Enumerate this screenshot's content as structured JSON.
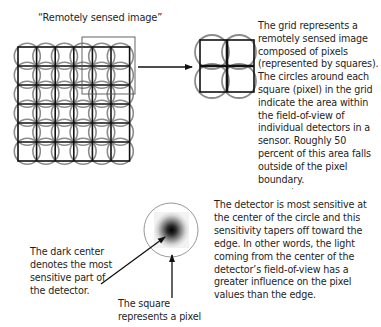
{
  "diagram": {
    "grid_title": "“Remotely sensed image”",
    "grid_description": "The grid represents a remotely sensed image composed of pixels (represented by squares). The circles around each square (pixel) in the grid indicate the area within the field-of-view of individual detectors in a sensor. Roughly 50 percent of this area falls outside of the pixel boundary.",
    "detector_description": "The detector is most sensitive at the center of the circle and this sensitivity tapers off toward the edge. In other words, the light coming from the center of the detector’s field-of-view has a greater influence on the pixel values than the edge.",
    "dark_center_caption": "The dark center denotes the most sensitive part of the detector.",
    "square_caption": "The square represents a pixel",
    "grid": {
      "rows": 6,
      "cols": 6,
      "magnified_rows": 2,
      "magnified_cols": 2
    },
    "colors": {
      "pixel_square": "#111111",
      "detector_circle": "#808080",
      "highlight_box": "#555555",
      "arrow": "#111111",
      "sensitivity_center": "#000000"
    }
  }
}
